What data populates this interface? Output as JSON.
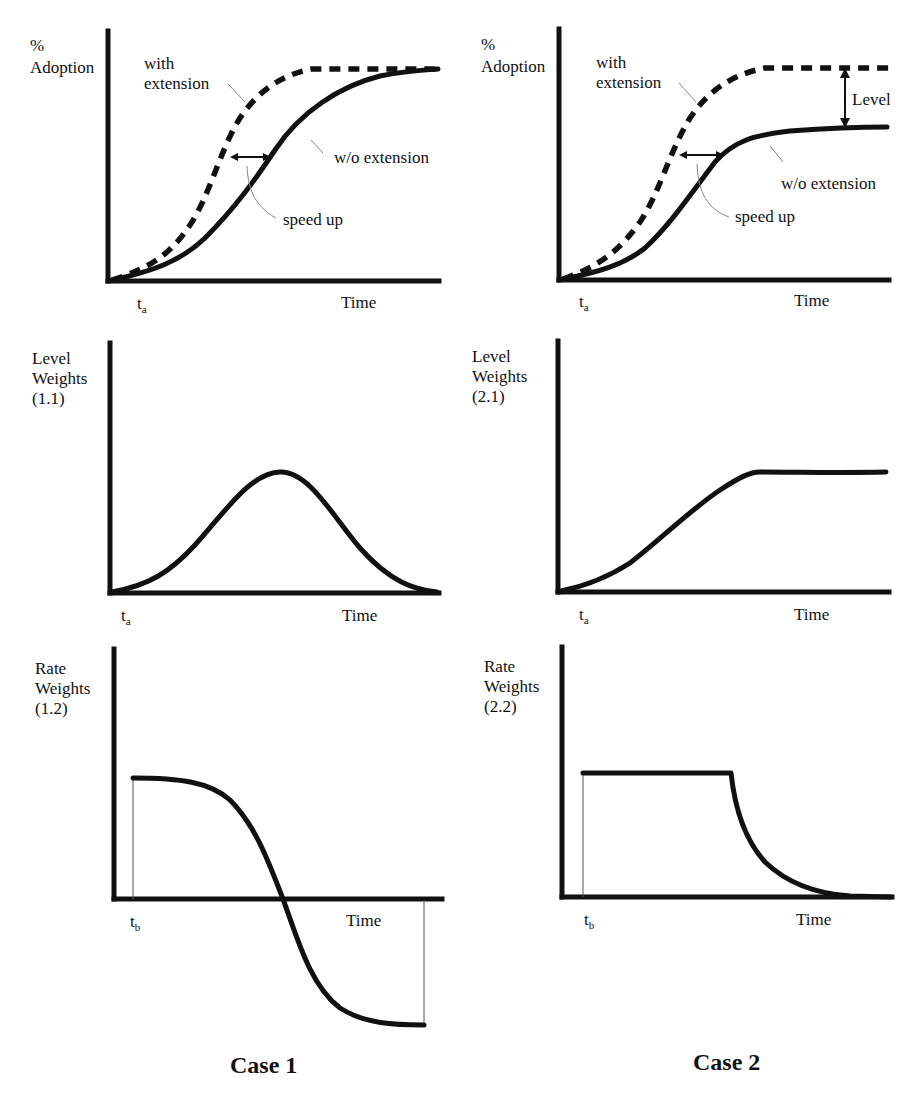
{
  "figure": {
    "case1_title": "Case 1",
    "case2_title": "Case 2",
    "panels": {
      "adoption_case1": {
        "ylabel_line1": "%",
        "ylabel_line2": "Adoption",
        "xlabel": "Time",
        "t_label": "t",
        "t_sub": "a",
        "with_line1": "with",
        "with_line2": "extension",
        "without": "w/o extension",
        "speedup": "speed up"
      },
      "adoption_case2": {
        "ylabel_line1": "%",
        "ylabel_line2": "Adoption",
        "xlabel": "Time",
        "t_label": "t",
        "t_sub": "a",
        "with_line1": "with",
        "with_line2": "extension",
        "without": "w/o extension",
        "speedup": "speed up",
        "level": "Level"
      },
      "level_case1": {
        "ylabel_line1": "Level",
        "ylabel_line2": "Weights",
        "ylabel_line3": "(1.1)",
        "xlabel": "Time",
        "t_label": "t",
        "t_sub": "a"
      },
      "level_case2": {
        "ylabel_line1": "Level",
        "ylabel_line2": "Weights",
        "ylabel_line3": "(2.1)",
        "xlabel": "Time",
        "t_label": "t",
        "t_sub": "a"
      },
      "rate_case1": {
        "ylabel_line1": "Rate",
        "ylabel_line2": "Weights",
        "ylabel_line3": "(1.2)",
        "xlabel": "Time",
        "t_label": "t",
        "t_sub": "b"
      },
      "rate_case2": {
        "ylabel_line1": "Rate",
        "ylabel_line2": "Weights",
        "ylabel_line3": "(2.2)",
        "xlabel": "Time",
        "t_label": "t",
        "t_sub": "b"
      }
    },
    "colors": {
      "ink": "#111111",
      "leader": "#888888",
      "background": "#ffffff"
    }
  }
}
